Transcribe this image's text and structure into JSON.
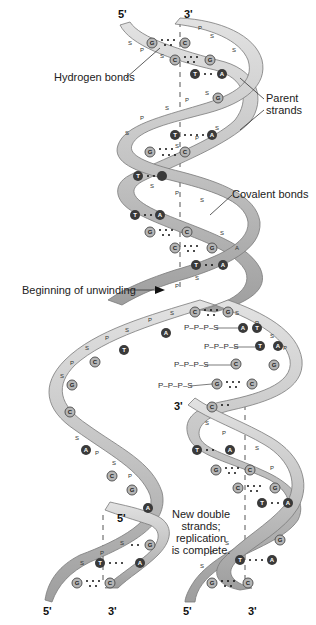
{
  "labels": {
    "hydrogen_bonds": "Hydrogen bonds",
    "parent_strands_line1": "Parent",
    "parent_strands_line2": "strands",
    "covalent_bonds": "Covalent bonds",
    "beginning_unwinding": "Beginning of unwinding",
    "complete_line1": "New double",
    "complete_line2": "strands;",
    "complete_line3": "replication",
    "complete_line4": "is complete."
  },
  "strand_ends": {
    "top_left": "5'",
    "top_right": "3'",
    "mid_right": "3'",
    "left_helix_top": "5'",
    "bottom_1": "5'",
    "bottom_2": "3'",
    "bottom_3": "5'",
    "bottom_4": "3'"
  },
  "free_nucleotides": [
    {
      "label": "P–P–P–S",
      "base": "A"
    },
    {
      "label": "P–P–P–S",
      "base": "T"
    },
    {
      "label": "P–P–P–S",
      "base": "C"
    },
    {
      "label": "P–P–P–S",
      "base": "G"
    }
  ],
  "backbone_units": [
    "P",
    "S"
  ],
  "bases": [
    "A",
    "T",
    "G",
    "C"
  ],
  "colors": {
    "ribbon": "#c8c8c8",
    "ribbon_edge": "#7a7a7a",
    "base_light": "#b5b5b5",
    "base_dark": "#3a3a3a",
    "text": "#222222"
  }
}
